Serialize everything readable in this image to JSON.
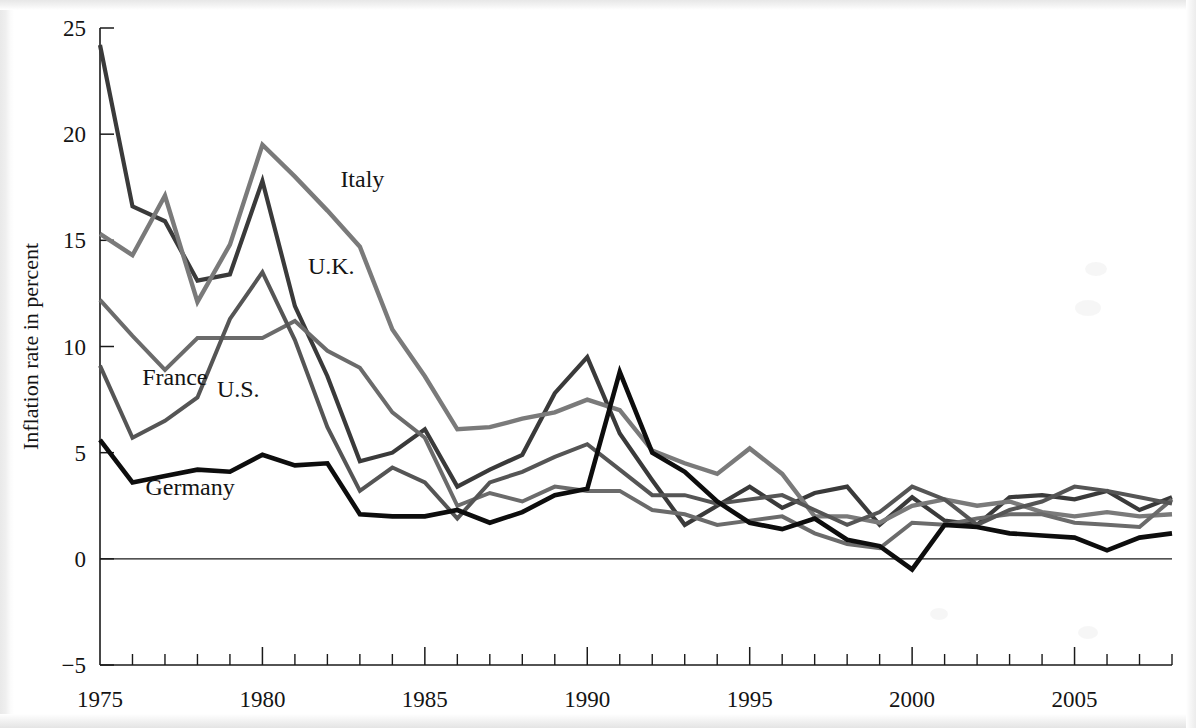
{
  "figure": {
    "type": "line-chart",
    "ylabel": "Inflation rate in percent",
    "y_ticks": [
      "25",
      "20",
      "15",
      "10",
      "5",
      "0",
      "-5"
    ],
    "x_ticks": [
      "1975",
      "1980",
      "1985",
      "1990",
      "1995",
      "2000",
      "2005"
    ],
    "series_labels": {
      "italy": "Italy",
      "uk": "U.K.",
      "france": "France",
      "us": "U.S.",
      "germany": "Germany"
    }
  },
  "chart_data": {
    "type": "line",
    "title": "",
    "xlabel": "",
    "ylabel": "Inflation rate in percent",
    "xlim": [
      1975,
      2008
    ],
    "ylim": [
      -5,
      25
    ],
    "y_ticks": [
      -5,
      0,
      5,
      10,
      15,
      20,
      25
    ],
    "x_ticks": [
      1975,
      1980,
      1985,
      1990,
      1995,
      2000,
      2005
    ],
    "x_minor_tick_step": 1,
    "grid": false,
    "legend": "inline-annotations",
    "x": [
      1975,
      1976,
      1977,
      1978,
      1979,
      1980,
      1981,
      1982,
      1983,
      1984,
      1985,
      1986,
      1987,
      1988,
      1989,
      1990,
      1991,
      1992,
      1993,
      1994,
      1995,
      1996,
      1997,
      1998,
      1999,
      2000,
      2001,
      2002,
      2003,
      2004,
      2005,
      2006,
      2007,
      2008
    ],
    "series": [
      {
        "name": "U.K.",
        "color": "#3a3a3a",
        "width": 4.2,
        "label_x": 1981.4,
        "label_y": 13.4,
        "values": [
          24.2,
          16.6,
          15.9,
          13.1,
          13.4,
          17.8,
          11.9,
          8.6,
          4.6,
          5.0,
          6.1,
          3.4,
          4.2,
          4.9,
          7.8,
          9.5,
          5.9,
          3.7,
          1.6,
          2.5,
          3.4,
          2.4,
          3.1,
          3.4,
          1.6,
          2.9,
          1.8,
          1.6,
          2.9,
          3.0,
          2.8,
          3.2,
          2.3,
          2.9
        ]
      },
      {
        "name": "Italy",
        "color": "#7a7a7a",
        "width": 4.4,
        "label_x": 1982.4,
        "label_y": 17.5,
        "values": [
          15.3,
          14.3,
          17.1,
          12.1,
          14.8,
          19.5,
          18.0,
          16.4,
          14.7,
          10.8,
          8.6,
          6.1,
          6.2,
          6.6,
          6.9,
          7.5,
          7.0,
          5.1,
          4.5,
          4.0,
          5.2,
          4.0,
          2.0,
          2.0,
          1.7,
          2.5,
          2.8,
          2.5,
          2.7,
          2.2,
          2.0,
          2.2,
          2.0,
          2.1
        ]
      },
      {
        "name": "France",
        "color": "#6b6b6b",
        "width": 4.0,
        "label_x": 1976.3,
        "label_y": 8.2,
        "values": [
          12.2,
          10.5,
          8.9,
          10.4,
          10.4,
          10.4,
          11.2,
          9.8,
          9.0,
          6.9,
          5.7,
          2.5,
          3.1,
          2.7,
          3.4,
          3.2,
          3.2,
          2.3,
          2.1,
          1.6,
          1.8,
          2.0,
          1.2,
          0.7,
          0.5,
          1.7,
          1.6,
          1.9,
          2.1,
          2.1,
          1.7,
          1.6,
          1.5,
          2.8
        ]
      },
      {
        "name": "U.S.",
        "color": "#555555",
        "width": 4.0,
        "label_x": 1978.6,
        "label_y": 7.6,
        "values": [
          9.1,
          5.7,
          6.5,
          7.6,
          11.3,
          13.5,
          10.3,
          6.2,
          3.2,
          4.3,
          3.6,
          1.9,
          3.6,
          4.1,
          4.8,
          5.4,
          4.2,
          3.0,
          3.0,
          2.6,
          2.8,
          3.0,
          2.3,
          1.6,
          2.2,
          3.4,
          2.8,
          1.6,
          2.3,
          2.7,
          3.4,
          3.2,
          2.9,
          2.6
        ]
      },
      {
        "name": "Germany",
        "color": "#0d0d0d",
        "width": 4.6,
        "label_x": 1976.4,
        "label_y": 3.0,
        "values": [
          5.6,
          3.6,
          3.9,
          4.2,
          4.1,
          4.9,
          4.4,
          4.5,
          2.1,
          2.0,
          2.0,
          2.3,
          1.7,
          2.2,
          3.0,
          3.3,
          8.8,
          5.0,
          4.1,
          2.7,
          1.7,
          1.4,
          1.9,
          0.9,
          0.6,
          -0.5,
          1.6,
          1.5,
          1.2,
          1.1,
          1.0,
          0.4,
          1.0,
          1.2
        ]
      }
    ]
  }
}
